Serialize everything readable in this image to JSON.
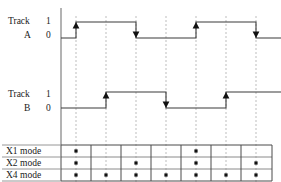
{
  "figure": {
    "type": "quadrature-encoder-timing-diagram",
    "background_color": "#ffffff",
    "line_color": "#3a3a3a",
    "axis_color": "#808080",
    "dashed_color": "#bdbdbd",
    "text_color": "#1a1a1a",
    "width": 281,
    "height": 182
  },
  "tracks": [
    {
      "id": "track-a",
      "name_line1": "Track",
      "name_line2": "A",
      "level_high_label": "1",
      "level_low_label": "0",
      "baseline_y": 38,
      "high_y": 22,
      "transitions": [
        {
          "edge": "rising",
          "at_column": 1,
          "x": 76,
          "marker": "up-arrow"
        },
        {
          "edge": "falling",
          "at_column": 3,
          "x": 136,
          "marker": "down-arrow"
        },
        {
          "edge": "rising",
          "at_column": 5,
          "x": 196,
          "marker": "up-arrow"
        },
        {
          "edge": "falling",
          "at_column": 7,
          "x": 256,
          "marker": "down-arrow"
        }
      ]
    },
    {
      "id": "track-b",
      "name_line1": "Track",
      "name_line2": "B",
      "level_high_label": "1",
      "level_low_label": "0",
      "baseline_y": 108,
      "high_y": 92,
      "transitions": [
        {
          "edge": "rising",
          "at_column": 2,
          "x": 106,
          "marker": "up-arrow"
        },
        {
          "edge": "falling",
          "at_column": 4,
          "x": 166,
          "marker": "down-arrow"
        },
        {
          "edge": "rising",
          "at_column": 6,
          "x": 226,
          "marker": "up-arrow"
        }
      ]
    }
  ],
  "edge_lines": {
    "count": 7,
    "x_positions": [
      76,
      106,
      136,
      166,
      196,
      226,
      256
    ],
    "style": "dashed",
    "top_y": 16,
    "bottom_y": 182
  },
  "axis": {
    "vertical_x": 61,
    "top_y": 8,
    "bottom_y": 145
  },
  "mode_table": {
    "left_x": 61,
    "right_x": 272,
    "top_y": 145,
    "row_height": 12,
    "column_boundaries": [
      61,
      91,
      121,
      151,
      181,
      211,
      241,
      272
    ],
    "rows": [
      {
        "label": "X1 mode",
        "dots": [
          true,
          false,
          false,
          false,
          true,
          false,
          false
        ]
      },
      {
        "label": "X2 mode",
        "dots": [
          true,
          false,
          true,
          false,
          true,
          false,
          true
        ]
      },
      {
        "label": "X4 mode",
        "dots": [
          true,
          true,
          true,
          true,
          true,
          true,
          true
        ]
      }
    ]
  }
}
